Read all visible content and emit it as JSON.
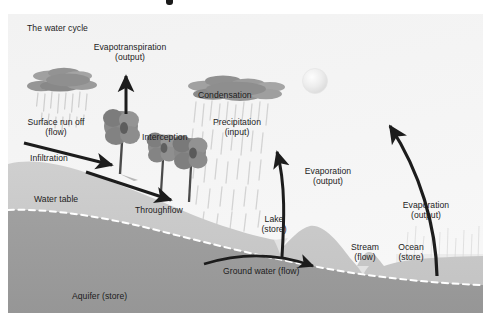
{
  "diagram": {
    "title": "The water cycle",
    "domain": "hydrology-water-cycle-diagram",
    "style": "grayscale textbook illustration",
    "background_color": "#f4f4f4",
    "ink_color": "#1c1c1c"
  },
  "labels": {
    "title": "The water cycle",
    "evapotranspiration": "Evapotranspiration\n(output)",
    "surface_runoff": "Surface run off\n(flow)",
    "infiltration": "Infiltration",
    "interception": "Interception",
    "water_table": "Water table",
    "throughflow": "Throughflow",
    "condensation": "Condensation",
    "precipitation": "Precipitation\n(input)",
    "evaporation_lake": "Evaporation\n(output)",
    "evaporation_ocean": "Evaporation\n(output)",
    "lake": "Lake\n(store)",
    "stream": "Stream\n(flow)",
    "ocean": "Ocean\n(store)",
    "ground_water": "Ground water (flow)",
    "aquifer": "Aquifer (store)"
  },
  "processes": [
    {
      "name": "Evapotranspiration",
      "kind": "output",
      "icon": "up-arrow-icon"
    },
    {
      "name": "Surface run off",
      "kind": "flow",
      "icon": "down-right-arrow-icon"
    },
    {
      "name": "Infiltration",
      "kind": "flow",
      "icon": "none"
    },
    {
      "name": "Interception",
      "kind": "store",
      "icon": "tree-icon"
    },
    {
      "name": "Throughflow",
      "kind": "flow",
      "icon": "down-right-arrow-icon"
    },
    {
      "name": "Condensation",
      "kind": "process",
      "icon": "cloud-icon"
    },
    {
      "name": "Precipitation",
      "kind": "input",
      "icon": "rain-icon"
    },
    {
      "name": "Evaporation",
      "kind": "output",
      "icon": "curved-up-arrow-icon"
    },
    {
      "name": "Ground water",
      "kind": "flow",
      "icon": "curved-right-arrow-icon"
    }
  ],
  "stores": [
    {
      "name": "Lake",
      "kind": "store"
    },
    {
      "name": "Ocean",
      "kind": "store"
    },
    {
      "name": "Aquifer",
      "kind": "store"
    },
    {
      "name": "Stream",
      "kind": "flow"
    }
  ],
  "colors": {
    "sky": "#f4f4f4",
    "upper_soil": "#c9c9c9",
    "aquifer": "#9b9b9b",
    "cloud": "#8e8e8e",
    "tree": "#7d7d7d",
    "water": "#e8e8e8",
    "rain": "#d5d5d5",
    "sun": "#ededed",
    "ink": "#1c1c1c",
    "water_table_line": "#ffffff"
  }
}
